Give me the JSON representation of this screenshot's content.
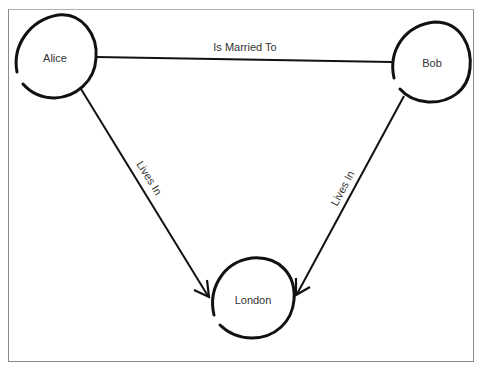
{
  "diagram": {
    "type": "graph",
    "nodes": [
      {
        "id": "alice",
        "label": "Alice"
      },
      {
        "id": "bob",
        "label": "Bob"
      },
      {
        "id": "london",
        "label": "London"
      }
    ],
    "edges": [
      {
        "from": "alice",
        "to": "bob",
        "label": "Is Married To"
      },
      {
        "from": "alice",
        "to": "london",
        "label": "Lives In"
      },
      {
        "from": "bob",
        "to": "london",
        "label": "Lives In"
      }
    ],
    "colors": {
      "stroke": "#111111",
      "text": "#333333",
      "frame": "#8a8a8a"
    }
  }
}
